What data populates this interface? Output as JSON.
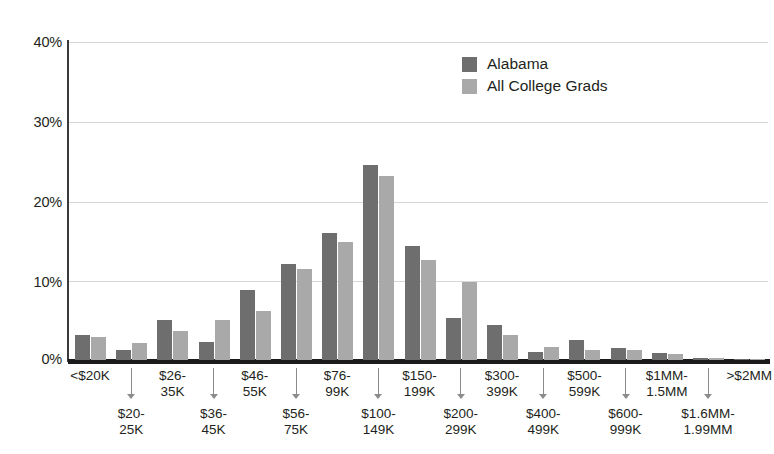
{
  "chart_data": {
    "type": "bar",
    "title": "",
    "subtitle": "",
    "xlabel": "",
    "ylabel": "",
    "ylim": [
      0,
      40
    ],
    "ytick_labels": [
      "0%",
      "10%",
      "20%",
      "30%",
      "40%"
    ],
    "ytick_values": [
      0,
      10,
      20,
      30,
      40
    ],
    "grid": true,
    "legend_position": "top-right",
    "categories": [
      "<$20K",
      "$20-25K",
      "$26-35K",
      "$36-45K",
      "$46-55K",
      "$56-75K",
      "$76-99K",
      "$100-149K",
      "$150-199K",
      "$200-299K",
      "$300-399K",
      "$400-499K",
      "$500-599K",
      "$600-999K",
      "$1MM-1.5MM",
      "$1.6MM-1.99MM",
      ">$2MM"
    ],
    "category_label_lines": [
      [
        "<$20K"
      ],
      [
        "$20-",
        "25K"
      ],
      [
        "$26-",
        "35K"
      ],
      [
        "$36-",
        "45K"
      ],
      [
        "$46-",
        "55K"
      ],
      [
        "$56-",
        "75K"
      ],
      [
        "$76-",
        "99K"
      ],
      [
        "$100-",
        "149K"
      ],
      [
        "$150-",
        "199K"
      ],
      [
        "$200-",
        "299K"
      ],
      [
        "$300-",
        "399K"
      ],
      [
        "$400-",
        "499K"
      ],
      [
        "$500-",
        "599K"
      ],
      [
        "$600-",
        "999K"
      ],
      [
        "$1MM-",
        "1.5MM"
      ],
      [
        "$1.6MM-",
        "1.99MM"
      ],
      [
        ">$2MM"
      ]
    ],
    "series": [
      {
        "name": "Alabama",
        "color": "#6e6e6e",
        "values": [
          3.2,
          1.2,
          5.0,
          2.3,
          8.8,
          12.1,
          16.0,
          24.5,
          14.4,
          5.3,
          4.4,
          1.0,
          2.5,
          1.5,
          0.9,
          0.2,
          0.1
        ]
      },
      {
        "name": "All College Grads",
        "color": "#a9a9a9",
        "values": [
          2.9,
          2.1,
          3.7,
          5.0,
          6.2,
          11.5,
          14.9,
          23.2,
          12.6,
          9.8,
          3.2,
          1.6,
          1.2,
          1.2,
          0.7,
          0.3,
          0.1
        ]
      }
    ]
  },
  "legend": {
    "items": [
      {
        "label": "Alabama",
        "color": "#6e6e6e"
      },
      {
        "label": "All College Grads",
        "color": "#a9a9a9"
      }
    ]
  }
}
